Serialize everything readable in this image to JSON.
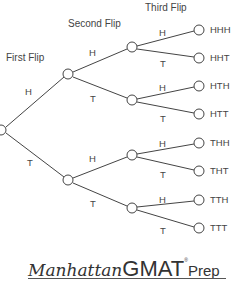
{
  "diagram": {
    "type": "probability-tree",
    "headers": {
      "first": "First Flip",
      "second": "Second Flip",
      "third": "Third Flip"
    },
    "branches": {
      "level1": [
        {
          "label": "H"
        },
        {
          "label": "T"
        }
      ],
      "level2": [
        {
          "label": "H"
        },
        {
          "label": "T"
        },
        {
          "label": "H"
        },
        {
          "label": "T"
        }
      ],
      "level3": [
        {
          "label": "H"
        },
        {
          "label": "T"
        },
        {
          "label": "H"
        },
        {
          "label": "T"
        },
        {
          "label": "H"
        },
        {
          "label": "T"
        },
        {
          "label": "H"
        },
        {
          "label": "T"
        }
      ]
    },
    "outcomes": [
      "HHH",
      "HHT",
      "HTH",
      "HTT",
      "THH",
      "THT",
      "TTH",
      "TTT"
    ],
    "colors": {
      "line": "#444444",
      "text": "#444444",
      "background": "#ffffff"
    }
  },
  "logo": {
    "manhattan": "Manhattan",
    "gmat": "GMAT",
    "registered": "®",
    "prep": "Prep"
  }
}
